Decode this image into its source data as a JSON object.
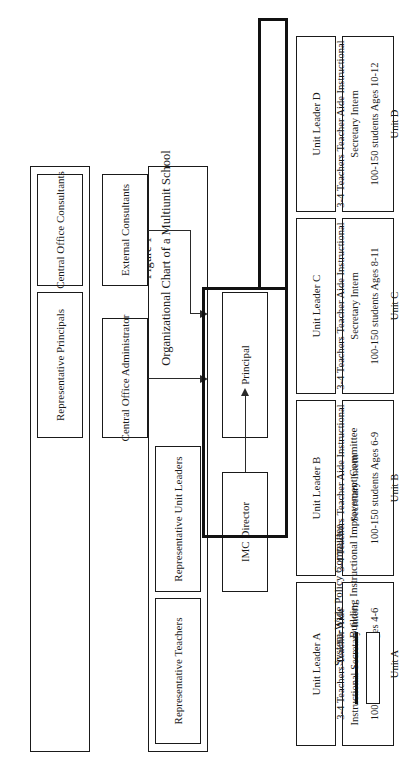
{
  "figure": {
    "label": "Figure 1",
    "title": "Organizational Chart of a Multiunit School"
  },
  "nodes": {
    "representative_principals": "Representative\nPrincipals",
    "representative_principals_l1": "Representative",
    "representative_principals_l2": "Principals",
    "central_office_consultants_l1": "Central Office",
    "central_office_consultants_l2": "Consultants",
    "representative_teachers_l1": "Representative",
    "representative_teachers_l2": "Teachers",
    "representative_unit_leaders_l1": "Representative",
    "representative_unit_leaders_l2": "Unit Leaders",
    "central_office_administrator_l1": "Central Office",
    "central_office_administrator_l2": "Administrator",
    "external_consultants_l1": "External",
    "external_consultants_l2": "Consultants",
    "principal": "Principal",
    "imc_director_l1": "IMC",
    "imc_director_l2": "Director"
  },
  "unit_leaders": [
    {
      "id": "unit-leader-a",
      "label": "Unit Leader A"
    },
    {
      "id": "unit-leader-b",
      "label": "Unit Leader B"
    },
    {
      "id": "unit-leader-c",
      "label": "Unit Leader C"
    },
    {
      "id": "unit-leader-d",
      "label": "Unit Leader D"
    }
  ],
  "units": [
    {
      "id": "unit-a",
      "footer": "Unit A",
      "staff": [
        "3-4 Teachers",
        "Teacher Aide",
        "Instructional",
        "Secretary",
        "Intern"
      ],
      "students": "100-150 students",
      "ages": "Ages 4-6"
    },
    {
      "id": "unit-b",
      "footer": "Unit B",
      "staff": [
        "3-4 Teachers",
        "Teacher Aide",
        "Instructional",
        "Secretary",
        "Intern"
      ],
      "students": "100-150 students",
      "ages": "Ages 6-9"
    },
    {
      "id": "unit-c",
      "footer": "Unit C",
      "staff": [
        "3-4 Teachers",
        "Teacher Aide",
        "Instructional",
        "Secretary",
        "Intern"
      ],
      "students": "100-150 students",
      "ages": "Ages 8-11"
    },
    {
      "id": "unit-d",
      "footer": "Unit D",
      "staff": [
        "3-4 Teachers",
        "Teacher Aide",
        "Instructional",
        "Secretary",
        "Intern"
      ],
      "students": "100-150 students",
      "ages": "Ages 10-12"
    }
  ],
  "legend": [
    {
      "id": "legend-biic",
      "swatch": "thick-line",
      "label": "Building Instructional Improvement Committee"
    },
    {
      "id": "legend-swpc",
      "swatch": "thin-box",
      "label": "System-Wide Policy Committee"
    }
  ],
  "colors": {
    "ink": "#1a1a1a",
    "line": "#2a2a2a",
    "committee_outline": "#111111",
    "background": "#ffffff"
  }
}
